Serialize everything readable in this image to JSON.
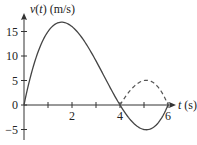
{
  "chart_data": {
    "type": "line",
    "title": "",
    "xlabel": "t (s)",
    "ylabel": "v(t) (m/s)",
    "xlabel_parts": {
      "var": "t",
      "unit": " (s)"
    },
    "ylabel_parts": {
      "var": "v",
      "open": "(",
      "arg": "t",
      "close": ")",
      "unit": " (m/s)"
    },
    "xlim": [
      0,
      6.2
    ],
    "ylim": [
      -6,
      18
    ],
    "x_ticks": [
      1,
      2,
      3,
      4,
      5,
      6
    ],
    "x_tick_labels": [
      {
        "t": 2,
        "label": "2"
      },
      {
        "t": 4,
        "label": "4"
      },
      {
        "t": 6,
        "label": "6"
      }
    ],
    "y_ticks": [
      -5,
      0,
      5,
      10,
      15
    ],
    "y_tick_labels": [
      "−5",
      "0",
      "5",
      "10",
      "15"
    ],
    "grid": false,
    "series": [
      {
        "name": "v(t)",
        "style": "solid",
        "formula": "t(4-t)(6-t)",
        "x": [
          0,
          0.5,
          1,
          1.5,
          1.6,
          2,
          2.5,
          3,
          3.5,
          4,
          4.5,
          5,
          5.06,
          5.5,
          6
        ],
        "values": [
          0,
          10.3,
          15,
          16.9,
          16.9,
          16,
          13.1,
          9,
          4.4,
          0,
          -3.4,
          -5,
          -5.0,
          -3.9,
          0
        ]
      },
      {
        "name": "|v(t)| reflected",
        "style": "dashed",
        "x": [
          4,
          4.5,
          5,
          5.06,
          5.5,
          6
        ],
        "values": [
          0,
          3.4,
          5,
          5.0,
          3.9,
          0
        ]
      }
    ]
  }
}
